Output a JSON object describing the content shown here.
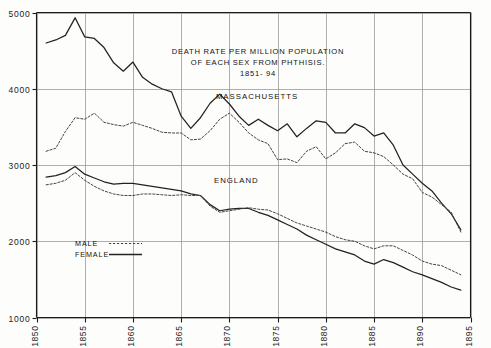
{
  "chart_data": {
    "type": "line",
    "title_lines": [
      "DEATH RATE PER MILLION POPULATION",
      "OF EACH SEX FROM PHTHISIS.",
      "1851- 94"
    ],
    "xlabel": "",
    "ylabel": "",
    "xlim": [
      1850,
      1895
    ],
    "ylim": [
      1000,
      5000
    ],
    "grid": true,
    "grid_x_values": [
      1850,
      1855,
      1860,
      1865,
      1870,
      1875,
      1880,
      1885,
      1890,
      1895
    ],
    "grid_y_values": [
      1000,
      2000,
      3000,
      4000,
      5000
    ],
    "xticks": [
      1850,
      1855,
      1860,
      1865,
      1870,
      1875,
      1880,
      1885,
      1890,
      1895
    ],
    "xtick_labels": [
      "1850",
      "1855",
      "1860",
      "1865",
      "1870",
      "1875",
      "1880",
      "1885",
      "1890",
      "1895"
    ],
    "yticks": [
      1000,
      2000,
      3000,
      4000,
      5000
    ],
    "ytick_labels": [
      "1000",
      "2000",
      "3000",
      "4000",
      "5000"
    ],
    "legend_position": "inside-lower-left",
    "legend_entries": [
      {
        "label": "MALE",
        "style": "dotted"
      },
      {
        "label": "FEMALE",
        "style": "solid"
      }
    ],
    "group_annotations": [
      {
        "label": "MASSACHUSETTS",
        "x": 1868.6,
        "y": 3860
      },
      {
        "label": "ENGLAND",
        "x": 1868.4,
        "y": 2760
      }
    ],
    "x": [
      1851,
      1852,
      1853,
      1854,
      1855,
      1856,
      1857,
      1858,
      1859,
      1860,
      1861,
      1862,
      1863,
      1864,
      1865,
      1866,
      1867,
      1868,
      1869,
      1870,
      1871,
      1872,
      1873,
      1874,
      1875,
      1876,
      1877,
      1878,
      1879,
      1880,
      1881,
      1882,
      1883,
      1884,
      1885,
      1886,
      1887,
      1888,
      1889,
      1890,
      1891,
      1892,
      1893,
      1894
    ],
    "series": [
      {
        "name": "MASSACHUSETTS FEMALE",
        "region": "Massachusetts",
        "sex": "Female",
        "style": "solid",
        "color": "#222222",
        "values": [
          4600,
          4640,
          4700,
          4930,
          4680,
          4660,
          4540,
          4340,
          4230,
          4350,
          4150,
          4060,
          4000,
          3960,
          3640,
          3480,
          3620,
          3810,
          3930,
          3800,
          3640,
          3520,
          3600,
          3520,
          3450,
          3540,
          3370,
          3480,
          3580,
          3560,
          3420,
          3420,
          3540,
          3490,
          3380,
          3420,
          3260,
          3000,
          2880,
          2760,
          2660,
          2500,
          2360,
          2150
        ]
      },
      {
        "name": "MASSACHUSETTS MALE",
        "region": "Massachusetts",
        "sex": "Male",
        "style": "dotted",
        "color": "#444444",
        "values": [
          3180,
          3220,
          3440,
          3620,
          3600,
          3680,
          3560,
          3530,
          3510,
          3560,
          3520,
          3480,
          3430,
          3420,
          3420,
          3330,
          3340,
          3450,
          3600,
          3680,
          3560,
          3420,
          3330,
          3280,
          3070,
          3080,
          3030,
          3180,
          3240,
          3080,
          3160,
          3280,
          3300,
          3180,
          3160,
          3110,
          3000,
          2880,
          2820,
          2640,
          2580,
          2480,
          2380,
          2120
        ]
      },
      {
        "name": "ENGLAND FEMALE",
        "region": "England",
        "sex": "Female",
        "style": "solid",
        "color": "#222222",
        "values": [
          2840,
          2860,
          2900,
          2980,
          2880,
          2830,
          2780,
          2750,
          2760,
          2760,
          2740,
          2720,
          2700,
          2680,
          2660,
          2620,
          2600,
          2480,
          2400,
          2420,
          2430,
          2430,
          2380,
          2340,
          2280,
          2220,
          2160,
          2080,
          2020,
          1960,
          1900,
          1860,
          1820,
          1740,
          1700,
          1760,
          1720,
          1660,
          1600,
          1560,
          1510,
          1460,
          1400,
          1360
        ]
      },
      {
        "name": "ENGLAND MALE",
        "region": "England",
        "sex": "Male",
        "style": "dotted",
        "color": "#444444",
        "values": [
          2740,
          2760,
          2800,
          2900,
          2800,
          2720,
          2660,
          2620,
          2600,
          2600,
          2620,
          2620,
          2610,
          2600,
          2610,
          2600,
          2600,
          2460,
          2380,
          2400,
          2420,
          2440,
          2420,
          2410,
          2360,
          2300,
          2240,
          2200,
          2160,
          2120,
          2060,
          2020,
          2000,
          1940,
          1900,
          1940,
          1940,
          1880,
          1820,
          1740,
          1700,
          1680,
          1620,
          1560
        ]
      }
    ]
  },
  "colors": {
    "background": "#fdfdfc",
    "axis": "#1c1c1c",
    "grid": "#9a9a9a",
    "solid_line": "#222222",
    "dotted_line": "#444444",
    "text": "#111111"
  }
}
